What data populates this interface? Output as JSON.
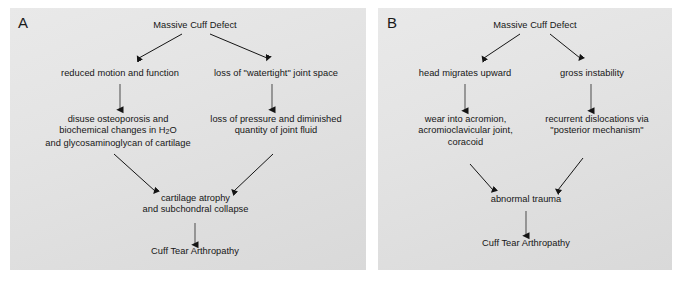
{
  "figure": {
    "background_color": "#ffffff",
    "panel_fill": "#e4e4e4",
    "text_color": "#161616",
    "arrow_color": "#1a1a1a",
    "caption": ""
  },
  "panel_a": {
    "letter": "A",
    "nodes": {
      "root": "Massive Cuff Defect",
      "left_1": "reduced motion and function",
      "right_1": "loss of \"watertight\" joint space",
      "left_2_line1": "disuse osteoporosis and",
      "left_2_line2_pre": "biochemical changes in H",
      "left_2_line2_sub": "2",
      "left_2_line2_post": "O",
      "left_2_line3": "and glycosaminoglycan of cartilage",
      "right_2": "loss of pressure and diminished\nquantity of joint fluid",
      "merge": "cartilage atrophy\nand subchondral collapse",
      "outcome": "Cuff Tear Arthropathy"
    }
  },
  "panel_b": {
    "letter": "B",
    "nodes": {
      "root": "Massive Cuff Defect",
      "left_1": "head migrates upward",
      "right_1": "gross instability",
      "left_2": "wear into acromion,\nacromioclavicular joint,\ncoracoid",
      "right_2": "recurrent dislocations via\n\"posterior mechanism\"",
      "merge": "abnormal trauma",
      "outcome": "Cuff Tear Arthropathy"
    }
  }
}
